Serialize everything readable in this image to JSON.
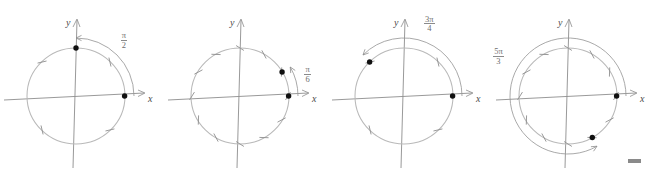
{
  "document": {
    "title": "Unit circle angle diagrams",
    "description": "Four unit-circle diagrams showing terminal-side angles measured from the positive x-axis",
    "figure_count": 4
  },
  "common": {
    "x_axis_label": "x",
    "y_axis_label": "y",
    "axis_color": "#8d8d8d",
    "circle_color": "#b9b9b9",
    "tick_color": "#8f8f8f",
    "arc_color": "#9a9a9a",
    "point_color": "#101010",
    "background": "#ffffff"
  },
  "figures": [
    {
      "id": "figure-1",
      "angle_label": {
        "numerator": "π",
        "denominator": "2",
        "text": "π/2"
      },
      "angle_degrees": 90,
      "direction": "counterclockwise",
      "tick_count": 4,
      "tick_spacing_degrees": 90,
      "tick_offset_degrees": 45,
      "points": [
        {
          "name": "initial-point",
          "angle_degrees": 0
        },
        {
          "name": "terminal-point",
          "angle_degrees": 90
        }
      ]
    },
    {
      "id": "figure-2",
      "angle_label": {
        "numerator": "π",
        "denominator": "6",
        "text": "π/6"
      },
      "angle_degrees": 30,
      "direction": "counterclockwise",
      "tick_count": 12,
      "tick_spacing_degrees": 30,
      "tick_offset_degrees": 30,
      "points": [
        {
          "name": "initial-point",
          "angle_degrees": 0
        },
        {
          "name": "terminal-point",
          "angle_degrees": 30
        }
      ]
    },
    {
      "id": "figure-3",
      "angle_label": {
        "numerator": "3π",
        "denominator": "4",
        "text": "3π/4"
      },
      "angle_degrees": 135,
      "direction": "counterclockwise",
      "tick_count": 4,
      "tick_spacing_degrees": 90,
      "tick_offset_degrees": 45,
      "points": [
        {
          "name": "initial-point",
          "angle_degrees": 0
        },
        {
          "name": "terminal-point",
          "angle_degrees": 135
        }
      ]
    },
    {
      "id": "figure-4",
      "angle_label": {
        "numerator": "5π",
        "denominator": "3",
        "text": "5π/3"
      },
      "angle_degrees": 300,
      "direction": "counterclockwise",
      "tick_count": 12,
      "tick_spacing_degrees": 30,
      "tick_offset_degrees": 30,
      "points": [
        {
          "name": "initial-point",
          "angle_degrees": 0
        },
        {
          "name": "terminal-point",
          "angle_degrees": 300
        }
      ]
    }
  ],
  "scale_bar": {
    "name": "scale-bar",
    "color": "#8a8a8a",
    "width_px": 13,
    "height_px": 4
  }
}
